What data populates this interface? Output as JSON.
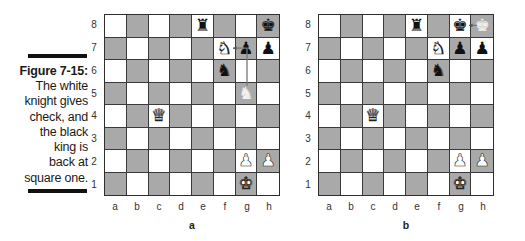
{
  "caption": {
    "title": "Figure 7-15:",
    "body_lines": [
      "The white",
      "knight gives",
      "check, and",
      "the black",
      "king is",
      "back at",
      "square one."
    ]
  },
  "colors": {
    "light_square": "#ffffff",
    "dark_square": "#a9a9a9",
    "border": "#2e2e2e",
    "caption_bar": "#111111"
  },
  "ranks": [
    "8",
    "7",
    "6",
    "5",
    "4",
    "3",
    "2",
    "1"
  ],
  "files": [
    "a",
    "b",
    "c",
    "d",
    "e",
    "f",
    "g",
    "h"
  ],
  "boards": [
    {
      "label": "a",
      "pieces": [
        {
          "square": "e8",
          "piece": "rook",
          "color": "black",
          "glyph": "♜"
        },
        {
          "square": "h8",
          "piece": "king",
          "color": "black",
          "glyph": "♚"
        },
        {
          "square": "f7",
          "piece": "knight",
          "color": "white",
          "glyph": "♞"
        },
        {
          "square": "g7",
          "piece": "pawn",
          "color": "black",
          "glyph": "♟"
        },
        {
          "square": "h7",
          "piece": "pawn",
          "color": "black",
          "glyph": "♟"
        },
        {
          "square": "f6",
          "piece": "knight",
          "color": "black",
          "glyph": "♞"
        },
        {
          "square": "g5",
          "piece": "knight",
          "color": "ghost",
          "glyph": "♞"
        },
        {
          "square": "c4",
          "piece": "queen",
          "color": "white",
          "glyph": "♛"
        },
        {
          "square": "g2",
          "piece": "pawn",
          "color": "white",
          "glyph": "♟"
        },
        {
          "square": "h2",
          "piece": "pawn",
          "color": "white",
          "glyph": "♟"
        },
        {
          "square": "g1",
          "piece": "king",
          "color": "white",
          "glyph": "♚"
        }
      ],
      "move_path": {
        "from": "g5",
        "via": "g7",
        "to": "f7",
        "description": "Knight g5 to f7 check"
      }
    },
    {
      "label": "b",
      "pieces": [
        {
          "square": "e8",
          "piece": "rook",
          "color": "black",
          "glyph": "♜"
        },
        {
          "square": "g8",
          "piece": "king",
          "color": "black",
          "glyph": "♚"
        },
        {
          "square": "h8",
          "piece": "king",
          "color": "ghost",
          "glyph": "♚"
        },
        {
          "square": "f7",
          "piece": "knight",
          "color": "white",
          "glyph": "♞"
        },
        {
          "square": "g7",
          "piece": "pawn",
          "color": "black",
          "glyph": "♟"
        },
        {
          "square": "h7",
          "piece": "pawn",
          "color": "black",
          "glyph": "♟"
        },
        {
          "square": "f6",
          "piece": "knight",
          "color": "black",
          "glyph": "♞"
        },
        {
          "square": "c4",
          "piece": "queen",
          "color": "white",
          "glyph": "♛"
        },
        {
          "square": "g2",
          "piece": "pawn",
          "color": "white",
          "glyph": "♟"
        },
        {
          "square": "h2",
          "piece": "pawn",
          "color": "white",
          "glyph": "♟"
        },
        {
          "square": "g1",
          "piece": "king",
          "color": "white",
          "glyph": "♚"
        }
      ],
      "move_path": {
        "from": "h8",
        "to": "g8",
        "description": "King h8 to g8"
      }
    }
  ]
}
